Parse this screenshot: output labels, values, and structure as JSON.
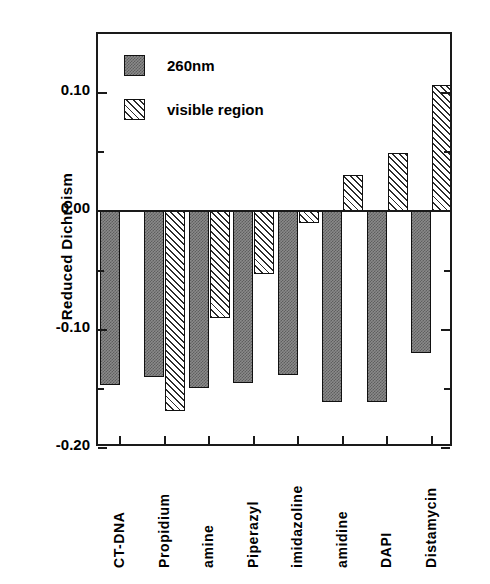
{
  "chart_data": {
    "type": "bar",
    "title": "",
    "subtitle": "",
    "xlabel": "",
    "ylabel": "Reduced  Dichroism",
    "ylim": [
      -0.2,
      0.15
    ],
    "yticks": [
      "0.10",
      "0.00",
      "-0.10",
      "-0.20"
    ],
    "ytick_values": [
      0.1,
      0.0,
      -0.1,
      -0.2
    ],
    "yminor_values": [
      0.05,
      -0.05,
      -0.15
    ],
    "grid": false,
    "legend_position": "upper-left-inside",
    "categories": [
      "CT-DNA",
      "Propidium",
      "amine",
      "Piperazyl",
      "imidazoline",
      "amidine",
      "DAPI",
      "Distamycin"
    ],
    "series": [
      {
        "name": "260nm",
        "fill": "stipple-dark-grey",
        "values": [
          -0.147,
          -0.14,
          -0.149,
          -0.145,
          -0.138,
          -0.161,
          -0.161,
          -0.12
        ]
      },
      {
        "name": "visible region",
        "fill": "diagonal-hatch",
        "values": [
          null,
          -0.169,
          -0.09,
          -0.053,
          -0.01,
          0.031,
          0.049,
          0.107
        ]
      }
    ],
    "annotations": []
  },
  "legend": {
    "entries": [
      {
        "label": "260nm"
      },
      {
        "label": "visible region"
      }
    ]
  },
  "axis": {
    "y_title": "Reduced  Dichroism"
  },
  "colors": {
    "axis": "#1a1a1a",
    "series_260nm": "#7d7d7d",
    "series_visible": "#2b2b2b",
    "background": "#ffffff"
  }
}
